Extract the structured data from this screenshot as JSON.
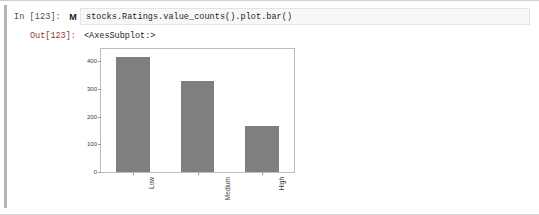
{
  "notebook": {
    "input": {
      "prompt": "In [123]:",
      "run_marker_icon": "markdown-run-marker-icon",
      "run_marker_glyph": "M",
      "code": "stocks.Ratings.value_counts().plot.bar()"
    },
    "output": {
      "prompt": "Out[123]:",
      "repr_text": "<AxesSubplot:>"
    }
  },
  "colors": {
    "bar_fill": "#7f7f7f",
    "axes_border": "#bdbdbd",
    "tick_color": "#9a9a9a",
    "code_text": "#232323",
    "in_prompt": "#4a4a4a",
    "out_prompt": "#8b3a1f",
    "gutter": "#b4b4b4",
    "code_background": "#f7f7f7",
    "page_background": "#ffffff"
  },
  "chart_data": {
    "type": "bar",
    "title": "",
    "xlabel": "",
    "ylabel": "",
    "categories": [
      "Low",
      "Medium",
      "High"
    ],
    "values": [
      415,
      331,
      165
    ],
    "ylim": [
      0,
      445
    ],
    "yticks": [
      0,
      100,
      200,
      300,
      400
    ],
    "ytick_labels": [
      "0",
      "100",
      "200",
      "300",
      "400"
    ],
    "grid": false,
    "legend": false,
    "legend_position": "none",
    "bar_color": "#7f7f7f",
    "xtick_rotation": 90
  }
}
